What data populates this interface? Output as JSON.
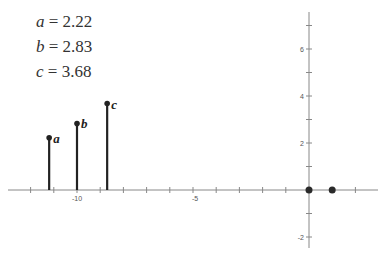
{
  "equations": [
    {
      "var": "a",
      "text": " = 2.22"
    },
    {
      "var": "b",
      "text": " = 2.83"
    },
    {
      "var": "c",
      "text": " = 3.68"
    }
  ],
  "caption": "",
  "chart_data": {
    "type": "scatter",
    "title": "",
    "xlabel": "",
    "ylabel": "",
    "xlim": [
      -12.5,
      3
    ],
    "ylim": [
      -2.5,
      7.6
    ],
    "grid": false,
    "x_tick_labels": [
      "-10",
      "-5"
    ],
    "y_tick_labels": [
      "6",
      "4",
      "2",
      "-2"
    ],
    "series": [
      {
        "name": "stems",
        "style": "stem",
        "points": [
          {
            "label": "a",
            "x": -11.2,
            "y": 2.22
          },
          {
            "label": "b",
            "x": -10.0,
            "y": 2.83
          },
          {
            "label": "c",
            "x": -8.7,
            "y": 3.68
          }
        ]
      },
      {
        "name": "axis points",
        "style": "dot",
        "points": [
          {
            "x": 0,
            "y": 0
          },
          {
            "x": 1,
            "y": 0
          }
        ]
      }
    ]
  }
}
